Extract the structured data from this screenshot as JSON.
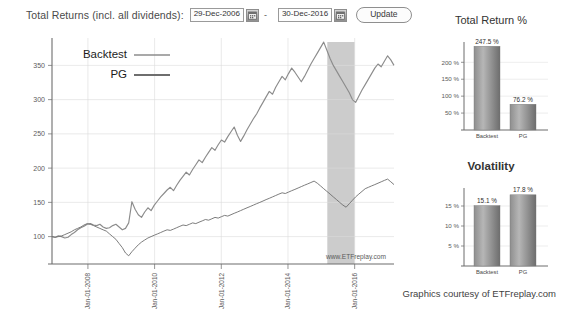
{
  "toolbar": {
    "label": "Total Returns (incl. all dividends):",
    "start_date": "29-Dec-2006",
    "end_date": "30-Dec-2016",
    "separator": "-",
    "update_label": "Update",
    "calendar_icon": "calendar-icon"
  },
  "credit": "Graphics courtesy of ETFreplay.com",
  "watermark": "www.ETFreplay.com",
  "chart_data": [
    {
      "id": "growth-chart",
      "type": "line",
      "title": "Total Returns (incl. all dividends)",
      "xlabel": "",
      "ylabel": "",
      "grid": true,
      "legend_position": "top-left",
      "xlim": [
        "29-Dec-2006",
        "30-Dec-2016"
      ],
      "ylim": [
        60,
        390
      ],
      "yticks": [
        100,
        150,
        200,
        250,
        300,
        350
      ],
      "ytick_labels": [
        "100",
        "150",
        "200",
        "250",
        "300",
        "350"
      ],
      "xticks": [
        "Jan-01-2008",
        "Jan-01-2010",
        "Jan-01-2012",
        "Jan-01-2014",
        "Jan-01-2016"
      ],
      "shaded_region": {
        "start": "Jan-2015",
        "end": "Sep-2015",
        "color": "#cccccc"
      },
      "series": [
        {
          "name": "Backtest",
          "color": "#8c8c8c",
          "values": [
            100,
            99,
            101,
            100,
            98,
            99,
            103,
            106,
            110,
            113,
            115,
            118,
            119,
            117,
            116,
            118,
            114,
            112,
            113,
            116,
            118,
            114,
            110,
            112,
            120,
            151,
            140,
            132,
            128,
            136,
            142,
            138,
            146,
            152,
            158,
            163,
            168,
            172,
            167,
            175,
            182,
            188,
            194,
            190,
            198,
            205,
            212,
            208,
            216,
            223,
            230,
            226,
            234,
            241,
            238,
            246,
            253,
            260,
            248,
            239,
            247,
            256,
            264,
            272,
            279,
            288,
            296,
            304,
            312,
            308,
            318,
            326,
            334,
            329,
            338,
            346,
            340,
            333,
            326,
            334,
            343,
            352,
            360,
            368,
            376,
            384,
            372,
            360,
            350,
            342,
            334,
            326,
            318,
            310,
            300,
            296,
            305,
            314,
            322,
            330,
            338,
            346,
            352,
            348,
            356,
            364,
            358,
            350
          ]
        },
        {
          "name": "PG",
          "color": "#6e6e6e",
          "values": [
            100,
            99,
            100,
            101,
            103,
            105,
            107,
            110,
            112,
            114,
            117,
            119,
            118,
            116,
            114,
            112,
            110,
            108,
            104,
            100,
            96,
            90,
            84,
            76,
            72,
            78,
            83,
            88,
            92,
            95,
            98,
            100,
            102,
            104,
            106,
            108,
            110,
            109,
            111,
            113,
            115,
            117,
            116,
            118,
            120,
            119,
            121,
            123,
            125,
            124,
            126,
            128,
            127,
            129,
            131,
            130,
            132,
            134,
            136,
            138,
            140,
            142,
            144,
            146,
            148,
            150,
            152,
            154,
            156,
            158,
            160,
            162,
            164,
            163,
            165,
            167,
            169,
            171,
            173,
            175,
            177,
            179,
            181,
            178,
            174,
            170,
            166,
            162,
            158,
            154,
            150,
            146,
            143,
            148,
            153,
            158,
            162,
            166,
            170,
            172,
            174,
            176,
            178,
            180,
            182,
            184,
            180,
            176
          ]
        }
      ]
    },
    {
      "id": "total-return-chart",
      "type": "bar",
      "title": "Total Return %",
      "categories": [
        "Backtest",
        "PG"
      ],
      "values": [
        247.5,
        76.2
      ],
      "value_labels": [
        "247.5 %",
        "76.2 %"
      ],
      "yticks": [
        50,
        100,
        150,
        200
      ],
      "ytick_labels": [
        "50 %",
        "100 %",
        "150 %",
        "200 %"
      ],
      "ylim": [
        0,
        260
      ],
      "xlabel": "",
      "ylabel": "",
      "grid": true
    },
    {
      "id": "volatility-chart",
      "type": "bar",
      "title": "Volatility",
      "categories": [
        "Backtest",
        "PG"
      ],
      "values": [
        15.1,
        17.8
      ],
      "value_labels": [
        "15.1 %",
        "17.8 %"
      ],
      "yticks": [
        5,
        10,
        15
      ],
      "ytick_labels": [
        "5 %",
        "10 %",
        "15 %"
      ],
      "ylim": [
        0,
        19.5
      ],
      "xlabel": "",
      "ylabel": "",
      "grid": true
    }
  ]
}
